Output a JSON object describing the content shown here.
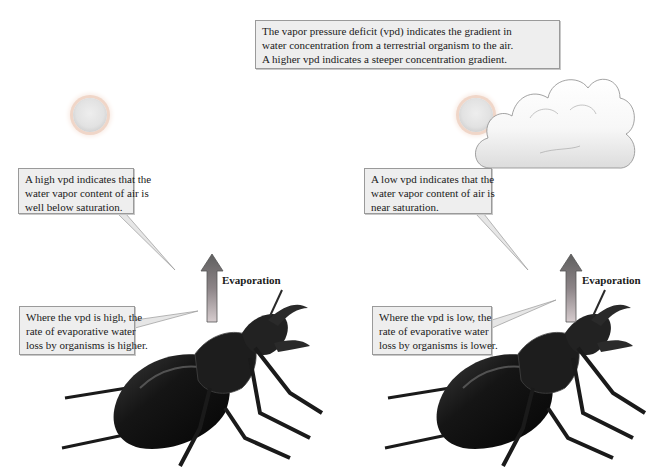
{
  "top_callout": {
    "lines": [
      "The vapor pressure deficit (vpd) indicates the gradient in",
      "water concentration from a terrestrial organism to the air.",
      "A higher vpd indicates a steeper concentration gradient."
    ]
  },
  "left_panel": {
    "condition": "high vpd (clear sky, sun)",
    "air_callout": {
      "lines": [
        "A high vpd indicates that the",
        "water vapor content of air is",
        "well below saturation."
      ]
    },
    "organism_callout": {
      "lines": [
        "Where the vpd is high, the",
        "rate of evaporative water",
        "loss by organisms is higher."
      ]
    },
    "arrow_label": "Evaporation"
  },
  "right_panel": {
    "condition": "low vpd (cloudy sky)",
    "air_callout": {
      "lines": [
        "A low vpd indicates that the",
        "water vapor content of air is",
        "near saturation."
      ]
    },
    "organism_callout": {
      "lines": [
        "Where the vpd is low, the",
        "rate of evaporative water",
        "loss by organisms is lower."
      ]
    },
    "arrow_label": "Evaporation"
  },
  "icons": {
    "sun": "sun-icon",
    "cloud": "cloud-icon",
    "arrow": "arrow-up-icon",
    "organism": "beetle-illustration"
  },
  "colors": {
    "callout_bg": "#eeeeee",
    "callout_border": "#9a9a9a",
    "arrow_top": "#6e6e6e",
    "arrow_bottom": "#cfc6c8",
    "beetle": "#1c1c1c"
  }
}
